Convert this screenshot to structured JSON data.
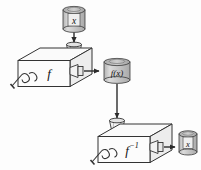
{
  "figure": {
    "type": "diagram",
    "background_color": "#fdfdfd",
    "line_color": "#2b2b2b",
    "fill_color": "#f4f4f4",
    "cylinder_fill": "#c9c9c9",
    "cylinder_top_fill": "#bdbdbd",
    "arrow_color": "#2b2b2b"
  },
  "nodes": {
    "input_can": {
      "label": "x",
      "name": "input-canister",
      "x": 62,
      "y": 6,
      "w": 24,
      "h": 28
    },
    "machine_forward": {
      "label": "f",
      "name": "function-machine-forward",
      "x": 16,
      "y": 46,
      "w": 74,
      "h": 40
    },
    "intermediate_can": {
      "label": "f(x)",
      "name": "intermediate-canister",
      "x": 103,
      "y": 58,
      "w": 28,
      "h": 26
    },
    "machine_inverse": {
      "label": "f",
      "exponent": "−1",
      "name": "function-machine-inverse",
      "x": 96,
      "y": 122,
      "w": 74,
      "h": 40
    },
    "output_can": {
      "label": "x",
      "name": "output-canister",
      "x": 176,
      "y": 130,
      "w": 22,
      "h": 26
    }
  },
  "edges": [
    {
      "name": "arrow-input-to-forward-machine",
      "from": "input_can",
      "to": "machine_forward",
      "direction": "down"
    },
    {
      "name": "arrow-forward-machine-to-intermediate",
      "from": "machine_forward",
      "to": "intermediate_can",
      "direction": "right"
    },
    {
      "name": "arrow-intermediate-to-inverse-machine",
      "from": "intermediate_can",
      "to": "machine_inverse",
      "direction": "down"
    },
    {
      "name": "arrow-inverse-machine-to-output",
      "from": "machine_inverse",
      "to": "output_can",
      "direction": "right"
    }
  ],
  "alt": {
    "caption": "A canister labeled x is poured into a function machine labeled f, producing a canister labeled f(x); that is poured into a machine labeled f to the negative one, producing a canister labeled x."
  }
}
